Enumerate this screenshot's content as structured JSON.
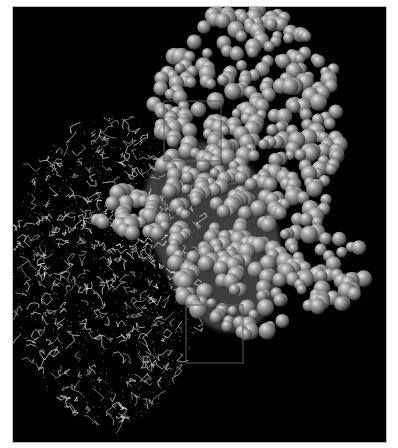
{
  "figure": {
    "background_color": "#000000",
    "frame_color": "#bdbdbd",
    "components": [
      {
        "name": "wireframe-molecule",
        "style": "stick/wire with dotted surface",
        "color": "#d8d8d8",
        "region": "lower-left"
      },
      {
        "name": "space-filling-molecule",
        "style": "CPK spheres",
        "color": "#8a8a8a",
        "region": "upper-right"
      },
      {
        "name": "molecular-surface",
        "style": "translucent gray surface",
        "color": "#4a4a4a",
        "region": "center"
      }
    ],
    "highlight_boxes": [
      {
        "x": 151,
        "y": 94,
        "w": 57,
        "h": 60
      },
      {
        "x": 173,
        "y": 298,
        "w": 57,
        "h": 58
      }
    ]
  }
}
